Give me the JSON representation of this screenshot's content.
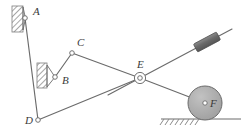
{
  "diagram": {
    "background": "#ffffff",
    "line_color": "#6b6b6b",
    "label_color": "#3a3a3a",
    "hatch_color": "#8a8a8a",
    "wheel_fill": "#a8a8a8",
    "slider_fill": "#6e6e6e",
    "joints": [
      {
        "id": "A",
        "label": "A",
        "x": 25,
        "y": 18,
        "label_x": 33,
        "label_y": 15,
        "type": "pin-support"
      },
      {
        "id": "B",
        "label": "B",
        "x": 55,
        "y": 77,
        "label_x": 62,
        "label_y": 84,
        "type": "pin-support"
      },
      {
        "id": "C",
        "label": "C",
        "x": 72,
        "y": 53,
        "label_x": 77,
        "label_y": 46,
        "type": "revolute"
      },
      {
        "id": "D",
        "label": "D",
        "x": 38,
        "y": 120,
        "label_x": 27,
        "label_y": 124,
        "type": "revolute"
      },
      {
        "id": "E",
        "label": "E",
        "x": 140,
        "y": 78,
        "label_x": 140,
        "label_y": 66,
        "type": "revolute-double"
      },
      {
        "id": "F",
        "label": "F",
        "x": 205,
        "y": 103,
        "label_x": 211,
        "label_y": 106,
        "type": "wheel-center"
      }
    ],
    "links": [
      {
        "name": "link-A-D",
        "from": "A",
        "to": "D"
      },
      {
        "name": "link-B-C",
        "from": "B",
        "to": "C"
      },
      {
        "name": "link-C-E",
        "from": "C",
        "to": "E"
      },
      {
        "name": "link-D-E-bar",
        "from": "D",
        "to": "E"
      },
      {
        "name": "link-E-F",
        "from": "E",
        "to": "F"
      }
    ],
    "bar": {
      "name": "inclined-bar",
      "x1": 108,
      "y1": 95,
      "x2": 232,
      "y2": 29
    },
    "slider": {
      "name": "slider-block",
      "cx": 207,
      "cy": 42,
      "w": 26,
      "h": 8,
      "angle": -28
    },
    "wheel": {
      "name": "wheel-F",
      "cx": 205,
      "cy": 103,
      "r": 17
    },
    "ground": {
      "name": "ground-line",
      "x1": 161,
      "y1": 119,
      "x2": 241,
      "y2": 119,
      "hatch_from": 163,
      "hatch_to": 200
    },
    "wall_a": {
      "x": 12,
      "y": 6,
      "w": 11,
      "h": 26
    },
    "wall_b": {
      "x": 37,
      "y": 63,
      "w": 10,
      "h": 25
    }
  }
}
